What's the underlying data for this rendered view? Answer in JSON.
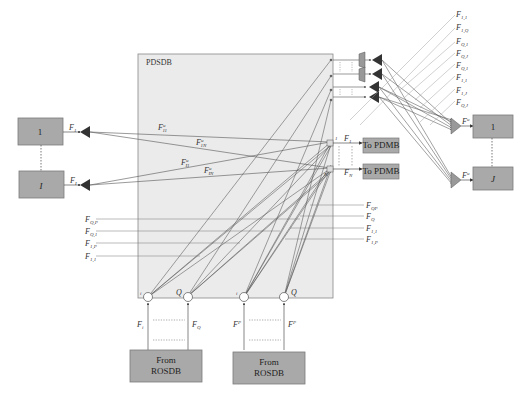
{
  "diagram": {
    "pdsdb": {
      "title": "PDSDB",
      "fill": "#ebebeb",
      "stroke": "#888888"
    },
    "left_nodes": [
      {
        "label": "1",
        "output_label": "F",
        "output_sub": "1",
        "output_sup": ""
      },
      {
        "label": "I",
        "output_label": "F",
        "output_sub": "I",
        "output_sup": ""
      }
    ],
    "right_nodes": [
      {
        "label": "1",
        "input_label": "F",
        "input_sup": "u",
        "input_sub": ""
      },
      {
        "label": "J",
        "input_label": "F",
        "input_sup": "u",
        "input_sub": ""
      }
    ],
    "to_pdmb": [
      {
        "label": "To PDMB",
        "signal": "F",
        "signal_sub": "1"
      },
      {
        "label": "To PDMB",
        "signal": "F",
        "signal_sub": "N"
      }
    ],
    "from_rosdb": [
      {
        "line1": "From",
        "line2": "ROSDB",
        "port_i": "i",
        "port_q": "Q",
        "sig_i": "F",
        "sig_i_sub": "i",
        "sig_q": "F",
        "sig_q_sub": "Q"
      },
      {
        "line1": "From",
        "line2": "ROSDB",
        "port_i": "i",
        "port_q": "Q",
        "sig_i": "F",
        "sig_i_sup": "P",
        "sig_i_sub": "i",
        "sig_q": "F",
        "sig_q_sup": "P",
        "sig_q_sub": "Q"
      }
    ],
    "inner_labels": [
      {
        "text": "F",
        "sup": "u",
        "sub": "11"
      },
      {
        "text": "F",
        "sup": "u",
        "sub": "1N"
      },
      {
        "text": "F",
        "sup": "u",
        "sub": "I1"
      },
      {
        "text": "F",
        "sup": "u",
        "sub": "IN"
      }
    ],
    "left_inputs": [
      {
        "text": "F",
        "sup": "'",
        "sub": "Q,P"
      },
      {
        "text": "F",
        "sup": "'",
        "sub": "Q,1"
      },
      {
        "text": "F",
        "sup": "'",
        "sub": "1,P"
      },
      {
        "text": "F",
        "sup": "'",
        "sub": "1,1"
      }
    ],
    "right_inputs": [
      {
        "text": "F",
        "sup": "P",
        "sub": "QP"
      },
      {
        "text": "F",
        "sup": "P",
        "sub": "Q"
      },
      {
        "text": "F",
        "sup": "P",
        "sub": "1,1"
      },
      {
        "text": "F",
        "sup": "P",
        "sub": "1,P"
      }
    ],
    "top_right_labels": [
      {
        "text": "F",
        "sup": "'",
        "sub": "1,1"
      },
      {
        "text": "F",
        "sup": "'",
        "sub": "1,Q"
      },
      {
        "text": "F",
        "sup": "'",
        "sub": "Q,1"
      },
      {
        "text": "F",
        "sup": "'",
        "sub": "Q,J"
      },
      {
        "text": "F",
        "sup": "P",
        "sub": "Q,1"
      },
      {
        "text": "F",
        "sup": "P",
        "sub": "1,1"
      },
      {
        "text": "F",
        "sup": "P",
        "sub": "1,J"
      },
      {
        "text": "F",
        "sup": "P",
        "sub": "Q,J"
      }
    ],
    "colors": {
      "box_fill": "#a9a9a9",
      "box_stroke": "#7a7a7a",
      "line": "#555555",
      "arrow": "#333333"
    }
  }
}
